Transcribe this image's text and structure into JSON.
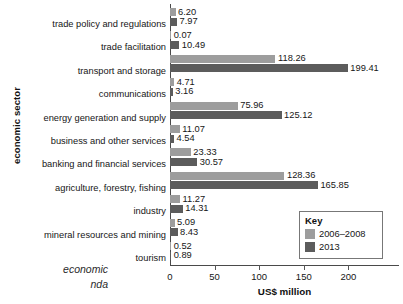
{
  "chart_data": {
    "type": "bar",
    "orientation": "horizontal",
    "title": "",
    "xlabel": "US$ million",
    "ylabel": "economic sector",
    "xlim": [
      0,
      233
    ],
    "xticks": [
      0,
      50,
      100,
      150,
      200
    ],
    "xtick_labels": [
      "0",
      "50",
      "100",
      "150",
      "200"
    ],
    "grid": false,
    "legend_position": "bottom-right",
    "legend_title": "Key",
    "categories": [
      "trade policy and regulations",
      "trade facilitation",
      "transport and storage",
      "communications",
      "energy generation and supply",
      "business and other services",
      "banking and financial services",
      "agriculture, forestry, fishing",
      "industry",
      "mineral resources and mining",
      "tourism"
    ],
    "series": [
      {
        "name": "2006–2008",
        "color": "#9d9d9d",
        "values": [
          6.2,
          0.07,
          118.26,
          4.71,
          75.96,
          11.07,
          23.33,
          128.36,
          11.27,
          5.09,
          0.52
        ],
        "value_labels": [
          "6.20",
          "0.07",
          "118.26",
          "4.71",
          "75.96",
          "11.07",
          "23.33",
          "128.36",
          "11.27",
          "5.09",
          "0.52"
        ]
      },
      {
        "name": "2013",
        "color": "#5c5c5c",
        "values": [
          7.97,
          10.49,
          199.41,
          3.16,
          125.12,
          4.54,
          30.57,
          165.85,
          14.31,
          8.43,
          0.89
        ],
        "value_labels": [
          "7.97",
          "10.49",
          "199.41",
          "3.16",
          "125.12",
          "4.54",
          "30.57",
          "165.85",
          "14.31",
          "8.43",
          "0.89"
        ]
      }
    ]
  },
  "legend": {
    "title": "Key",
    "entries": [
      {
        "label": "2006–2008",
        "color": "#9d9d9d"
      },
      {
        "label": "2013",
        "color": "#5c5c5c"
      }
    ]
  },
  "axes": {
    "x_title": "US$ million",
    "y_title": "economic sector"
  },
  "caption": {
    "line1": "economic",
    "line2": "nda"
  }
}
